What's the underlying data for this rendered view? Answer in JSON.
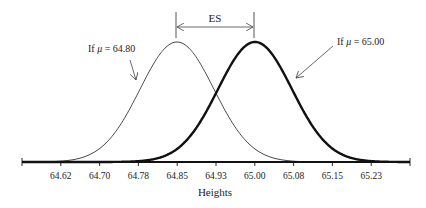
{
  "chart_data": {
    "type": "line",
    "title": "",
    "xlabel": "Heights",
    "ylabel": "",
    "x_ticks": [
      "64.62",
      "64.70",
      "64.78",
      "64.85",
      "64.93",
      "65.00",
      "65.08",
      "65.15",
      "65.23"
    ],
    "xlim": [
      64.54,
      65.31
    ],
    "grid": false,
    "legend": "none",
    "series": [
      {
        "name": "If μ = 64.80",
        "distribution": "normal",
        "center_tick": "64.85",
        "line": "thin"
      },
      {
        "name": "If μ = 65.00",
        "distribution": "normal",
        "center_tick": "65.00",
        "line": "thick"
      }
    ],
    "annotations": [
      {
        "text": "ES",
        "type": "double-arrow",
        "from_tick": "64.85",
        "to_tick": "65.00"
      },
      {
        "text": "If μ = 64.80",
        "type": "arrow-label",
        "points_to": "left curve"
      },
      {
        "text": "If μ = 65.00",
        "type": "arrow-label",
        "points_to": "right curve"
      }
    ]
  },
  "labels": {
    "x_axis_title": "Heights",
    "es": "ES",
    "left_prefix": "If ",
    "left_mu": "μ",
    "left_value": " = 64.80",
    "right_prefix": "If ",
    "right_mu": "μ",
    "right_value": " = 65.00"
  },
  "ticks": [
    "64.62",
    "64.70",
    "64.78",
    "64.85",
    "64.93",
    "65.00",
    "65.08",
    "65.15",
    "65.23"
  ],
  "colors": {
    "line": "#111111",
    "thin_line": "#333333",
    "text": "#222222"
  }
}
